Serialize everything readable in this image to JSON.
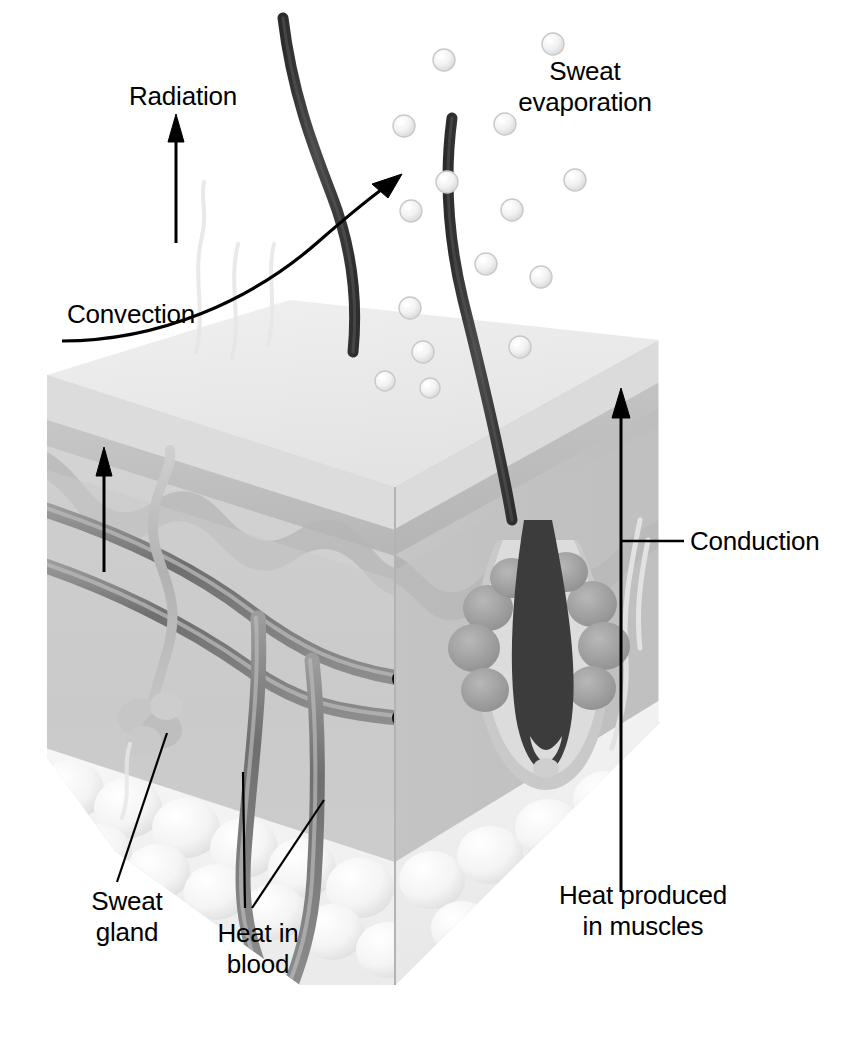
{
  "figure": {
    "type": "anatomical-diagram",
    "background_color": "#ffffff",
    "ink_color": "#000000"
  },
  "labels": {
    "radiation": "Radiation",
    "convection": "Convection",
    "sweat_evaporation_line1": "Sweat",
    "sweat_evaporation_line2": "evaporation",
    "conduction": "Conduction",
    "heat_produced_line1": "Heat produced",
    "heat_produced_line2": "in muscles",
    "sweat_gland_line1": "Sweat",
    "sweat_gland_line2": "gland",
    "heat_in_blood_line1": "Heat in",
    "heat_in_blood_line2": "blood"
  },
  "structures": {
    "epidermis": "epidermis-layer",
    "dermis": "dermis-layer",
    "subcutaneous_fat": "subcutaneous-fat-layer",
    "hair_shaft": "hair-shaft",
    "hair_follicle": "hair-follicle",
    "sebaceous_gland": "sebaceous-gland",
    "sweat_gland": "sweat-gland-coil",
    "sweat_duct": "sweat-duct",
    "blood_vessel": "blood-vessel",
    "sweat_droplet": "sweat-droplet"
  },
  "colors": {
    "skin_top": "#ececec",
    "skin_front": "#cfcfcf",
    "skin_side": "#c2c2c2",
    "epidermis_band": "#b9b9b9",
    "dermis": "#c8c8c8",
    "fat": "#f2f2f2",
    "vessel": "#8a8a8a",
    "vessel_light": "#b0b0b0",
    "hair": "#3a3a3a",
    "follicle": "#9a9a9a",
    "droplet": "#f4f4f4",
    "droplet_edge": "#c9c9c9",
    "line": "#000000"
  },
  "arrows": [
    {
      "name": "radiation-arrow",
      "direction": "up",
      "from": [
        176,
        240
      ],
      "to": [
        176,
        120
      ]
    },
    {
      "name": "convection-arrow",
      "direction": "up-right",
      "from": [
        60,
        340
      ],
      "to": [
        399,
        176
      ]
    },
    {
      "name": "conduction-leader",
      "direction": "right",
      "from": [
        621,
        540
      ],
      "to": [
        683,
        540
      ]
    },
    {
      "name": "heat-produced-arrow",
      "direction": "up",
      "from": [
        621,
        890
      ],
      "to": [
        621,
        390
      ]
    },
    {
      "name": "internal-heat-arrow",
      "direction": "up",
      "from": [
        104,
        570
      ],
      "to": [
        104,
        448
      ]
    },
    {
      "name": "sweat-gland-leader",
      "direction": "up-right",
      "from": [
        118,
        880
      ],
      "to": [
        166,
        735
      ]
    },
    {
      "name": "heat-in-blood-leader-a",
      "direction": "up",
      "from": [
        246,
        905
      ],
      "to": [
        244,
        775
      ]
    },
    {
      "name": "heat-in-blood-leader-b",
      "direction": "up-right",
      "from": [
        250,
        905
      ],
      "to": [
        322,
        805
      ]
    }
  ],
  "droplets": [
    {
      "cx": 444,
      "cy": 60,
      "r": 11
    },
    {
      "cx": 553,
      "cy": 44,
      "r": 11
    },
    {
      "cx": 404,
      "cy": 126,
      "r": 11
    },
    {
      "cx": 505,
      "cy": 124,
      "r": 11
    },
    {
      "cx": 447,
      "cy": 182,
      "r": 11
    },
    {
      "cx": 575,
      "cy": 180,
      "r": 11
    },
    {
      "cx": 411,
      "cy": 211,
      "r": 11
    },
    {
      "cx": 512,
      "cy": 210,
      "r": 11
    },
    {
      "cx": 486,
      "cy": 264,
      "r": 11
    },
    {
      "cx": 541,
      "cy": 277,
      "r": 11
    },
    {
      "cx": 410,
      "cy": 308,
      "r": 11
    },
    {
      "cx": 423,
      "cy": 352,
      "r": 11
    },
    {
      "cx": 520,
      "cy": 347,
      "r": 11
    },
    {
      "cx": 385,
      "cy": 381,
      "r": 10
    },
    {
      "cx": 430,
      "cy": 388,
      "r": 10
    }
  ]
}
